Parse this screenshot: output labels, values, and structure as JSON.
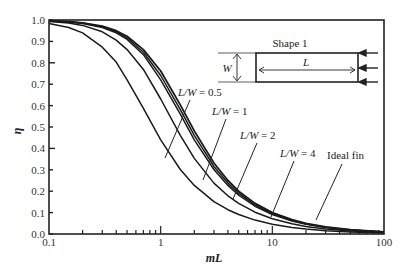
{
  "chart_data": {
    "type": "line",
    "title": "",
    "xlabel": "mL",
    "ylabel": "η",
    "xscale": "log",
    "xlim": [
      0.1,
      100
    ],
    "ylim": [
      0.0,
      1.0
    ],
    "x_ticks": [
      "0.1",
      "1",
      "10",
      "100"
    ],
    "y_ticks": [
      "0.0",
      "0.1",
      "0.2",
      "0.3",
      "0.4",
      "0.5",
      "0.6",
      "0.7",
      "0.8",
      "0.9",
      "1.0"
    ],
    "grid": false,
    "x": [
      0.1,
      0.15,
      0.2,
      0.3,
      0.4,
      0.5,
      0.7,
      1,
      1.5,
      2,
      3,
      4,
      5,
      7,
      10,
      15,
      20,
      30,
      50,
      100
    ],
    "series": [
      {
        "name": "Ideal fin",
        "values": [
          0.9967,
          0.9926,
          0.9869,
          0.971,
          0.9499,
          0.9242,
          0.8615,
          0.7616,
          0.6034,
          0.482,
          0.3317,
          0.2498,
          0.2,
          0.1429,
          0.1,
          0.0667,
          0.05,
          0.0333,
          0.02,
          0.01
        ]
      },
      {
        "name": "L/W = 4",
        "values": [
          0.9963,
          0.9918,
          0.9856,
          0.9681,
          0.9449,
          0.9168,
          0.8495,
          0.7406,
          0.5812,
          0.4614,
          0.3159,
          0.2379,
          0.1905,
          0.1361,
          0.0952,
          0.0635,
          0.0476,
          0.0317,
          0.019,
          0.0095
        ]
      },
      {
        "name": "L/W = 2",
        "values": [
          0.996,
          0.991,
          0.9842,
          0.9651,
          0.9399,
          0.9093,
          0.838,
          0.7202,
          0.5603,
          0.44,
          0.3013,
          0.2271,
          0.1818,
          0.1299,
          0.0909,
          0.0606,
          0.0455,
          0.0303,
          0.0182,
          0.0091
        ]
      },
      {
        "name": "L/W = 1",
        "values": [
          0.9935,
          0.9856,
          0.9747,
          0.9449,
          0.9063,
          0.8615,
          0.7692,
          0.631,
          0.4614,
          0.3535,
          0.2379,
          0.1786,
          0.1429,
          0.102,
          0.0714,
          0.0476,
          0.0357,
          0.0238,
          0.0143,
          0.0071
        ]
      },
      {
        "name": "L/W = 0.5",
        "values": [
          0.9842,
          0.9651,
          0.9399,
          0.8727,
          0.8033,
          0.7202,
          0.5868,
          0.44,
          0.3013,
          0.2271,
          0.1515,
          0.1136,
          0.0909,
          0.0649,
          0.0455,
          0.0303,
          0.0227,
          0.0152,
          0.0091,
          0.0045
        ]
      }
    ],
    "annotations": [
      {
        "text_prefix": "L/W",
        "text_suffix": " = 0.5",
        "series": "L/W = 0.5"
      },
      {
        "text_prefix": "L/W",
        "text_suffix": " = 1",
        "series": "L/W = 1"
      },
      {
        "text_prefix": "L/W",
        "text_suffix": " = 2",
        "series": "L/W = 2"
      },
      {
        "text_prefix": "L/W",
        "text_suffix": " = 4",
        "series": "L/W = 4"
      },
      {
        "text_prefix": "",
        "text_suffix": "Ideal fin",
        "series": "Ideal fin"
      }
    ],
    "inset": {
      "title": "Shape 1",
      "width_label": "W",
      "length_label": "L"
    },
    "legend": "none"
  }
}
